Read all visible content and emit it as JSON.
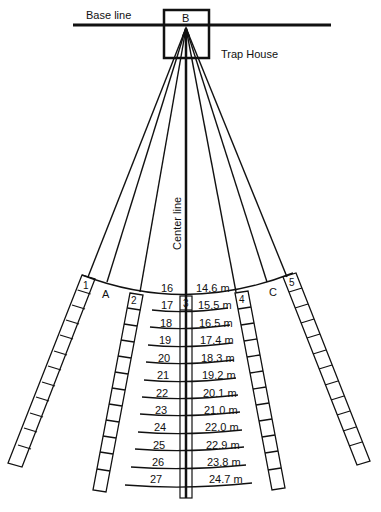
{
  "diagram": {
    "labels": {
      "base_line": "Base line",
      "trap_house": "Trap House",
      "point_b": "B",
      "center_line": "Center line",
      "point_a": "A",
      "point_c": "C"
    },
    "stations": [
      "1",
      "2",
      "3",
      "4",
      "5"
    ],
    "yardage_rows": [
      {
        "row": "16",
        "distance": "14.6 m"
      },
      {
        "row": "17",
        "distance": "15.5 m"
      },
      {
        "row": "18",
        "distance": "16.5 m"
      },
      {
        "row": "19",
        "distance": "17.4 m"
      },
      {
        "row": "20",
        "distance": "18.3 m"
      },
      {
        "row": "21",
        "distance": "19.2 m"
      },
      {
        "row": "22",
        "distance": "20.1 m"
      },
      {
        "row": "23",
        "distance": "21.0 m"
      },
      {
        "row": "24",
        "distance": "22.0 m"
      },
      {
        "row": "25",
        "distance": "22.9 m"
      },
      {
        "row": "26",
        "distance": "23.8 m"
      },
      {
        "row": "27",
        "distance": "24.7 m"
      }
    ]
  }
}
